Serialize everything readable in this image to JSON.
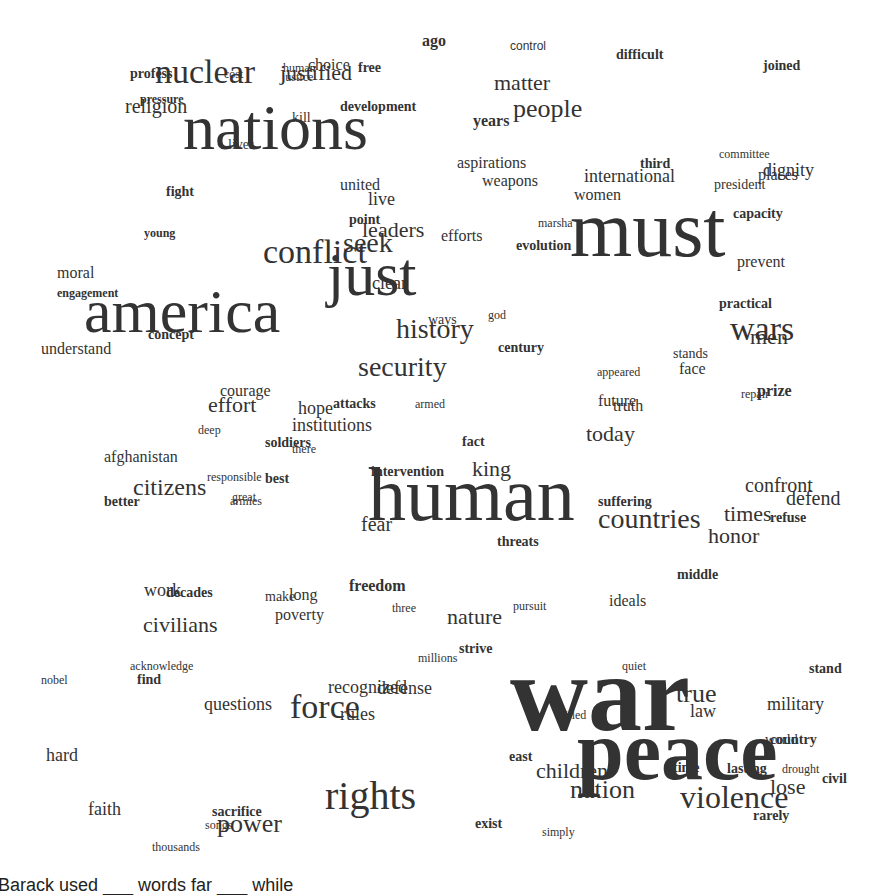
{
  "word_cloud": {
    "text_color": "#333333",
    "background": "#ffffff",
    "words": [
      {
        "t": "nations",
        "x": 183,
        "y": 147,
        "s": 64
      },
      {
        "t": "must",
        "x": 570,
        "y": 253,
        "s": 80
      },
      {
        "t": "america",
        "x": 84,
        "y": 330,
        "s": 62
      },
      {
        "t": "just",
        "x": 327,
        "y": 293,
        "s": 62
      },
      {
        "t": "human",
        "x": 368,
        "y": 517,
        "s": 76
      },
      {
        "t": "war",
        "x": 510,
        "y": 726,
        "s": 108,
        "b": 1
      },
      {
        "t": "peace",
        "x": 577,
        "y": 776,
        "s": 84,
        "b": 1
      },
      {
        "t": "rights",
        "x": 325,
        "y": 808,
        "s": 40
      },
      {
        "t": "violence",
        "x": 680,
        "y": 807,
        "s": 32
      },
      {
        "t": "nuclear",
        "x": 155,
        "y": 82,
        "s": 34
      },
      {
        "t": "conflict",
        "x": 263,
        "y": 262,
        "s": 34
      },
      {
        "t": "wars",
        "x": 730,
        "y": 339,
        "s": 34
      },
      {
        "t": "force",
        "x": 290,
        "y": 717,
        "s": 34
      },
      {
        "t": "people",
        "x": 513,
        "y": 117,
        "s": 26
      },
      {
        "t": "history",
        "x": 396,
        "y": 337,
        "s": 28
      },
      {
        "t": "security",
        "x": 358,
        "y": 375,
        "s": 28
      },
      {
        "t": "citizens",
        "x": 133,
        "y": 494,
        "s": 24
      },
      {
        "t": "countries",
        "x": 598,
        "y": 527,
        "s": 28
      },
      {
        "t": "nation",
        "x": 570,
        "y": 798,
        "s": 26
      },
      {
        "t": "children",
        "x": 536,
        "y": 778,
        "s": 22
      },
      {
        "t": "power",
        "x": 217,
        "y": 832,
        "s": 26
      },
      {
        "t": "seek",
        "x": 343,
        "y": 251,
        "s": 28
      },
      {
        "t": "leaders",
        "x": 362,
        "y": 237,
        "s": 22
      },
      {
        "t": "matter",
        "x": 494,
        "y": 90,
        "s": 22
      },
      {
        "t": "today",
        "x": 586,
        "y": 441,
        "s": 22
      },
      {
        "t": "king",
        "x": 472,
        "y": 476,
        "s": 22
      },
      {
        "t": "times",
        "x": 724,
        "y": 521,
        "s": 22
      },
      {
        "t": "honor",
        "x": 708,
        "y": 543,
        "s": 22
      },
      {
        "t": "confront",
        "x": 745,
        "y": 491,
        "s": 20
      },
      {
        "t": "defend",
        "x": 786,
        "y": 504,
        "s": 20
      },
      {
        "t": "men",
        "x": 750,
        "y": 344,
        "s": 22
      },
      {
        "t": "effort",
        "x": 208,
        "y": 412,
        "s": 22
      },
      {
        "t": "civilians",
        "x": 143,
        "y": 632,
        "s": 22
      },
      {
        "t": "nature",
        "x": 447,
        "y": 624,
        "s": 22
      },
      {
        "t": "justified",
        "x": 280,
        "y": 80,
        "s": 22
      },
      {
        "t": "religion",
        "x": 125,
        "y": 112,
        "s": 20
      },
      {
        "t": "fear",
        "x": 361,
        "y": 530,
        "s": 20
      },
      {
        "t": "institutions",
        "x": 292,
        "y": 430,
        "s": 18
      },
      {
        "t": "afghanistan",
        "x": 104,
        "y": 462,
        "s": 16
      },
      {
        "t": "understand",
        "x": 41,
        "y": 354,
        "s": 16
      },
      {
        "t": "moral",
        "x": 57,
        "y": 278,
        "s": 16
      },
      {
        "t": "united",
        "x": 340,
        "y": 190,
        "s": 16
      },
      {
        "t": "live",
        "x": 368,
        "y": 204,
        "s": 18
      },
      {
        "t": "aspirations",
        "x": 457,
        "y": 168,
        "s": 16
      },
      {
        "t": "weapons",
        "x": 482,
        "y": 186,
        "s": 16
      },
      {
        "t": "international",
        "x": 584,
        "y": 181,
        "s": 18
      },
      {
        "t": "women",
        "x": 574,
        "y": 200,
        "s": 16
      },
      {
        "t": "dignity",
        "x": 763,
        "y": 175,
        "s": 18
      },
      {
        "t": "prevent",
        "x": 737,
        "y": 267,
        "s": 16
      },
      {
        "t": "efforts",
        "x": 441,
        "y": 241,
        "s": 16
      },
      {
        "t": "years",
        "x": 473,
        "y": 126,
        "s": 16,
        "b": 1
      },
      {
        "t": "questions",
        "x": 204,
        "y": 709,
        "s": 18
      },
      {
        "t": "recognized",
        "x": 328,
        "y": 692,
        "s": 18
      },
      {
        "t": "defense",
        "x": 377,
        "y": 693,
        "s": 18
      },
      {
        "t": "rules",
        "x": 340,
        "y": 719,
        "s": 18
      },
      {
        "t": "faith",
        "x": 88,
        "y": 814,
        "s": 18
      },
      {
        "t": "hard",
        "x": 46,
        "y": 760,
        "s": 18
      },
      {
        "t": "lose",
        "x": 770,
        "y": 794,
        "s": 22
      },
      {
        "t": "true",
        "x": 676,
        "y": 702,
        "s": 26
      },
      {
        "t": "law",
        "x": 690,
        "y": 716,
        "s": 18
      },
      {
        "t": "military",
        "x": 767,
        "y": 709,
        "s": 18
      },
      {
        "t": "ideals",
        "x": 609,
        "y": 606,
        "s": 16
      },
      {
        "t": "hope",
        "x": 298,
        "y": 413,
        "s": 18
      },
      {
        "t": "courage",
        "x": 220,
        "y": 396,
        "s": 16
      },
      {
        "t": "work",
        "x": 144,
        "y": 595,
        "s": 18
      },
      {
        "t": "future",
        "x": 598,
        "y": 406,
        "s": 16
      },
      {
        "t": "truth",
        "x": 613,
        "y": 411,
        "s": 16
      },
      {
        "t": "face",
        "x": 679,
        "y": 374,
        "s": 16
      },
      {
        "t": "stands",
        "x": 673,
        "y": 358,
        "s": 14
      },
      {
        "t": "prize",
        "x": 757,
        "y": 396,
        "s": 16,
        "b": 1
      },
      {
        "t": "repair",
        "x": 741,
        "y": 398,
        "s": 12
      },
      {
        "t": "god",
        "x": 488,
        "y": 319,
        "s": 12
      },
      {
        "t": "ways",
        "x": 428,
        "y": 324,
        "s": 14
      },
      {
        "t": "century",
        "x": 498,
        "y": 352,
        "s": 14,
        "b": 1
      },
      {
        "t": "appeared",
        "x": 597,
        "y": 376,
        "s": 12
      },
      {
        "t": "practical",
        "x": 719,
        "y": 308,
        "s": 14,
        "b": 1
      },
      {
        "t": "committee",
        "x": 719,
        "y": 158,
        "s": 12
      },
      {
        "t": "places",
        "x": 758,
        "y": 180,
        "s": 16
      },
      {
        "t": "president",
        "x": 714,
        "y": 189,
        "s": 14
      },
      {
        "t": "capacity",
        "x": 733,
        "y": 218,
        "s": 14,
        "b": 1
      },
      {
        "t": "third",
        "x": 640,
        "y": 168,
        "s": 14,
        "b": 1
      },
      {
        "t": "marsha",
        "x": 538,
        "y": 227,
        "s": 12
      },
      {
        "t": "evolution",
        "x": 516,
        "y": 250,
        "s": 14,
        "b": 1
      },
      {
        "t": "point",
        "x": 349,
        "y": 224,
        "s": 14,
        "b": 1
      },
      {
        "t": "clear",
        "x": 372,
        "y": 288,
        "s": 18
      },
      {
        "t": "young",
        "x": 144,
        "y": 237,
        "s": 12,
        "b": 1
      },
      {
        "t": "fight",
        "x": 166,
        "y": 196,
        "s": 14,
        "b": 1
      },
      {
        "t": "engagement",
        "x": 57,
        "y": 297,
        "s": 12,
        "b": 1
      },
      {
        "t": "concept",
        "x": 148,
        "y": 339,
        "s": 14,
        "b": 1
      },
      {
        "t": "profess",
        "x": 130,
        "y": 78,
        "s": 14,
        "b": 1
      },
      {
        "t": "pressure",
        "x": 140,
        "y": 103,
        "s": 12,
        "b": 1
      },
      {
        "t": "cost",
        "x": 224,
        "y": 78,
        "s": 12
      },
      {
        "t": "human",
        "x": 283,
        "y": 72,
        "s": 12
      },
      {
        "t": "choice",
        "x": 308,
        "y": 70,
        "s": 16
      },
      {
        "t": "free",
        "x": 358,
        "y": 72,
        "s": 14,
        "b": 1
      },
      {
        "t": "justice",
        "x": 282,
        "y": 81,
        "s": 12
      },
      {
        "t": "kill",
        "x": 292,
        "y": 122,
        "s": 14
      },
      {
        "t": "lives",
        "x": 228,
        "y": 149,
        "s": 14
      },
      {
        "t": "development",
        "x": 340,
        "y": 111,
        "s": 14,
        "b": 1
      },
      {
        "t": "ago",
        "x": 422,
        "y": 46,
        "s": 16,
        "b": 1
      },
      {
        "t": "control",
        "x": 510,
        "y": 50,
        "s": 12,
        "sans": 1
      },
      {
        "t": "difficult",
        "x": 616,
        "y": 59,
        "s": 14,
        "b": 1
      },
      {
        "t": "joined",
        "x": 763,
        "y": 70,
        "s": 14,
        "b": 1
      },
      {
        "t": "attacks",
        "x": 333,
        "y": 408,
        "s": 14,
        "b": 1
      },
      {
        "t": "armed",
        "x": 415,
        "y": 408,
        "s": 12
      },
      {
        "t": "deep",
        "x": 198,
        "y": 434,
        "s": 12
      },
      {
        "t": "soldiers",
        "x": 265,
        "y": 447,
        "s": 14,
        "b": 1
      },
      {
        "t": "there",
        "x": 292,
        "y": 453,
        "s": 12
      },
      {
        "t": "fact",
        "x": 462,
        "y": 446,
        "s": 14,
        "b": 1
      },
      {
        "t": "intervention",
        "x": 371,
        "y": 476,
        "s": 14,
        "b": 1
      },
      {
        "t": "responsible",
        "x": 207,
        "y": 481,
        "s": 12
      },
      {
        "t": "best",
        "x": 265,
        "y": 483,
        "s": 14,
        "b": 1
      },
      {
        "t": "better",
        "x": 104,
        "y": 506,
        "s": 14,
        "b": 1
      },
      {
        "t": "great",
        "x": 232,
        "y": 501,
        "s": 12
      },
      {
        "t": "armies",
        "x": 230,
        "y": 505,
        "s": 12
      },
      {
        "t": "suffering",
        "x": 598,
        "y": 506,
        "s": 14,
        "b": 1
      },
      {
        "t": "refuse",
        "x": 770,
        "y": 522,
        "s": 14,
        "b": 1
      },
      {
        "t": "threats",
        "x": 497,
        "y": 546,
        "s": 14,
        "b": 1
      },
      {
        "t": "middle",
        "x": 677,
        "y": 579,
        "s": 14,
        "b": 1
      },
      {
        "t": "decades",
        "x": 166,
        "y": 597,
        "s": 14,
        "b": 1
      },
      {
        "t": "make",
        "x": 265,
        "y": 601,
        "s": 14
      },
      {
        "t": "long",
        "x": 289,
        "y": 600,
        "s": 16
      },
      {
        "t": "poverty",
        "x": 275,
        "y": 620,
        "s": 16
      },
      {
        "t": "freedom",
        "x": 349,
        "y": 591,
        "s": 16,
        "b": 1
      },
      {
        "t": "three",
        "x": 392,
        "y": 612,
        "s": 12
      },
      {
        "t": "pursuit",
        "x": 513,
        "y": 610,
        "s": 12
      },
      {
        "t": "millions",
        "x": 418,
        "y": 662,
        "s": 12
      },
      {
        "t": "strive",
        "x": 459,
        "y": 653,
        "s": 14,
        "b": 1
      },
      {
        "t": "acknowledge",
        "x": 130,
        "y": 670,
        "s": 12
      },
      {
        "t": "find",
        "x": 137,
        "y": 684,
        "s": 14,
        "b": 1
      },
      {
        "t": "nobel",
        "x": 41,
        "y": 684,
        "s": 12
      },
      {
        "t": "quiet",
        "x": 622,
        "y": 670,
        "s": 12
      },
      {
        "t": "stand",
        "x": 809,
        "y": 673,
        "s": 14,
        "b": 1
      },
      {
        "t": "killed",
        "x": 559,
        "y": 719,
        "s": 12
      },
      {
        "t": "country",
        "x": 770,
        "y": 744,
        "s": 14,
        "b": 1
      },
      {
        "t": "world",
        "x": 765,
        "y": 744,
        "s": 14
      },
      {
        "t": "east",
        "x": 509,
        "y": 761,
        "s": 14,
        "b": 1
      },
      {
        "t": "time",
        "x": 673,
        "y": 772,
        "s": 14,
        "b": 1
      },
      {
        "t": "lasting",
        "x": 727,
        "y": 773,
        "s": 14,
        "b": 1
      },
      {
        "t": "drought",
        "x": 782,
        "y": 773,
        "s": 12
      },
      {
        "t": "civil",
        "x": 822,
        "y": 783,
        "s": 14,
        "b": 1
      },
      {
        "t": "rarely",
        "x": 753,
        "y": 820,
        "s": 14,
        "b": 1
      },
      {
        "t": "exist",
        "x": 475,
        "y": 828,
        "s": 14,
        "b": 1
      },
      {
        "t": "simply",
        "x": 542,
        "y": 836,
        "s": 12
      },
      {
        "t": "sacrifice",
        "x": 212,
        "y": 816,
        "s": 14,
        "b": 1
      },
      {
        "t": "songs",
        "x": 205,
        "y": 829,
        "s": 12
      },
      {
        "t": "thousands",
        "x": 152,
        "y": 851,
        "s": 12
      }
    ]
  },
  "caption": "Barack used ___ words far ___ while"
}
